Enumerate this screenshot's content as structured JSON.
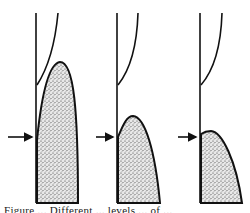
{
  "figure": {
    "type": "diagram",
    "stipple_color": "#555555",
    "line_color": "#111111",
    "panels": [
      {
        "id": 1,
        "vertical_line_x": 36,
        "upper_curve": "M58,13 C55,45 48,68 37,85",
        "stipple_path": "M37,203 L37,140 C40,110 46,64 60,62 C74,62 78,110 78,203 Z",
        "arrow": {
          "x1": 8,
          "x2": 33,
          "y": 137
        }
      },
      {
        "id": 2,
        "vertical_line_x": 117,
        "upper_curve": "M138,13 C137,45 130,70 118,85",
        "stipple_path": "M118,203 L118,137 C122,128 126,116 133,116 C145,117 155,150 160,203 Z",
        "arrow": {
          "x1": 96,
          "x2": 114,
          "y": 137
        }
      },
      {
        "id": 3,
        "vertical_line_x": 200,
        "upper_curve": "M222,13 C221,45 214,70 201,85",
        "stipple_path": "M201,203 L201,134 C204,132 207,131 211,131 C222,132 236,160 242,203 Z",
        "arrow": {
          "x1": 178,
          "x2": 197,
          "y": 137
        }
      }
    ]
  },
  "caption": "Figure ... Different ... levels ... of ..."
}
